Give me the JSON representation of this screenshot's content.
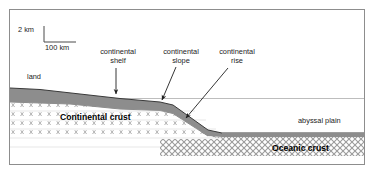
{
  "diagram": {
    "scale_bar": {
      "vertical_label": "2 km",
      "horizontal_label": "100 km"
    },
    "labels": {
      "land": "land",
      "continental_shelf": "continental\nshelf",
      "continental_shelf_line1": "continental",
      "continental_shelf_line2": "shelf",
      "continental_slope_line1": "continental",
      "continental_slope_line2": "slope",
      "continental_rise_line1": "continental",
      "continental_rise_line2": "rise",
      "abyssal_plain": "abyssal plain",
      "continental_crust": "Continental crust",
      "oceanic_crust": "Oceanic crust"
    },
    "colors": {
      "border": "#8d8d8d",
      "background": "#ffffff",
      "text": "#1c1c1c",
      "bold_text": "#000000",
      "sediment": "#8a8a8a",
      "sea_level_line": "#b8b8b8",
      "crust_outline": "#3a3a3a",
      "leader_line": "#2b2b2b"
    }
  }
}
